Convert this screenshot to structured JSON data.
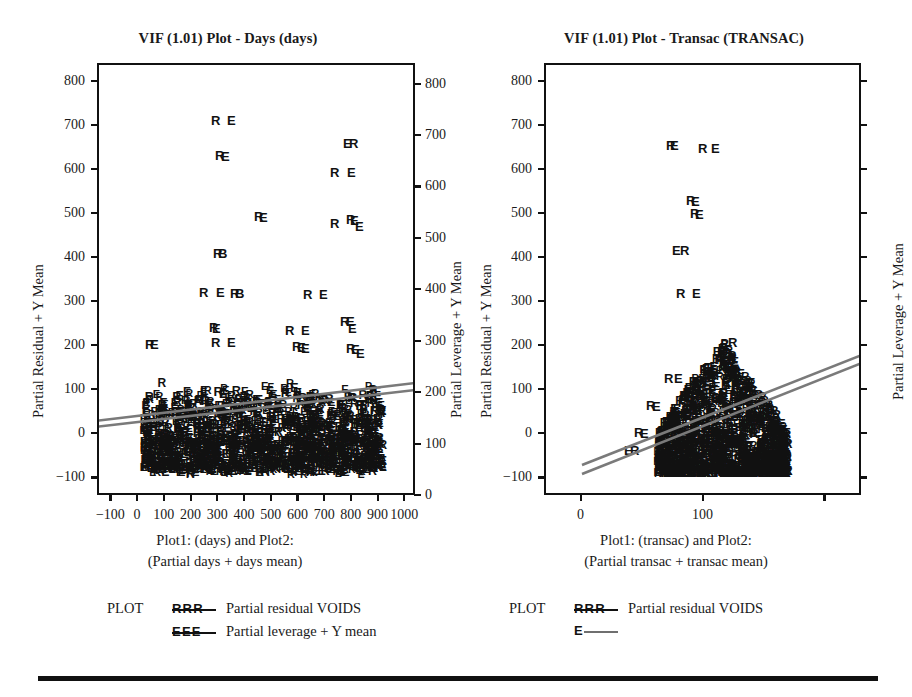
{
  "figure": {
    "background": "#ffffff",
    "ink_color": "#111111",
    "regression_line_color": "#7a7a7a",
    "bottom_rule": true
  },
  "legend_common": {
    "plot_word": "PLOT",
    "residual_keys": "R R R",
    "leverage_keys": "E E E",
    "residual_label": "Partial residual VOIDS",
    "leverage_label": "Partial leverage + Y mean"
  },
  "panels": [
    {
      "id": "left",
      "title": "VIF (1.01) Plot - Days (days)",
      "caption_line1": "Plot1: (days) and Plot2:",
      "caption_line2": "(Partial days + days mean)",
      "y_left_title": "Partial Residual + Y Mean",
      "y_right_title": "Partial Leverage + Y Mean",
      "y_left_ticks": [
        "800",
        "700",
        "600",
        "500",
        "400",
        "300",
        "200",
        "100",
        "0",
        "-100"
      ],
      "y_right_ticks": [
        "800",
        "700",
        "600",
        "500",
        "400",
        "300",
        "200",
        "100",
        "0"
      ],
      "x_ticks": [
        "-100",
        "0",
        "100",
        "200",
        "300",
        "400",
        "500",
        "600",
        "700",
        "800",
        "900",
        "1000"
      ],
      "legend_rows": [
        {
          "keys": "R R R",
          "label": "Partial residual VOIDS",
          "style": "keys"
        },
        {
          "keys": "E E E",
          "label": "Partial leverage + Y mean",
          "style": "keys"
        }
      ]
    },
    {
      "id": "right",
      "title": "VIF (1.01) Plot - Transac (TRANSAC)",
      "caption_line1": "Plot1: (transac) and Plot2:",
      "caption_line2": "(Partial transac + transac mean)",
      "y_left_title": "Partial Residual + Y Mean",
      "y_right_title": "Partial Leverage + Y Mean",
      "y_left_ticks": [
        "800",
        "700",
        "600",
        "500",
        "400",
        "300",
        "200",
        "100",
        "0",
        "-100"
      ],
      "y_right_ticks": [],
      "x_ticks": [
        "0",
        "100",
        "",
        ""
      ],
      "legend_rows": [
        {
          "keys": "R R R",
          "label": "Partial residual VOIDS",
          "style": "keys"
        },
        {
          "keys": "E",
          "label": "",
          "style": "line"
        }
      ]
    }
  ],
  "chart_data": [
    {
      "type": "scatter",
      "panel": "left",
      "title": "VIF (1.01) Plot - Days (days)",
      "xlabel": "Plot1: (days) and Plot2: (Partial days + days mean)",
      "ylabel": "Partial Residual + Y Mean",
      "y2label": "Partial Leverage + Y Mean",
      "xlim": [
        -150,
        1040
      ],
      "ylim": [
        -140,
        840
      ],
      "y2lim": [
        0,
        840
      ],
      "xticks": [
        -100,
        0,
        100,
        200,
        300,
        400,
        500,
        600,
        700,
        800,
        900,
        1000
      ],
      "yticks": [
        -100,
        0,
        100,
        200,
        300,
        400,
        500,
        600,
        700,
        800
      ],
      "y2ticks": [
        0,
        100,
        200,
        300,
        400,
        500,
        600,
        700,
        800
      ],
      "grid": false,
      "legend_position": "below-axes",
      "series": [
        {
          "name": "Partial residual VOIDS",
          "marker": "R",
          "outliers": [
            [
              320,
              712
            ],
            [
              333,
              644
            ],
            [
              368,
              525
            ],
            [
              348,
              455
            ],
            [
              265,
              382
            ],
            [
              350,
              352
            ],
            [
              742,
              655
            ],
            [
              700,
              622
            ],
            [
              700,
              522
            ],
            [
              745,
              520
            ],
            [
              625,
              320
            ],
            [
              660,
              245
            ],
            [
              700,
              230
            ],
            [
              710,
              212
            ],
            [
              200,
              210
            ],
            [
              300,
              192
            ],
            [
              150,
              170
            ],
            [
              575,
              205
            ],
            [
              600,
              160
            ]
          ]
        },
        {
          "name": "Partial leverage + Y mean",
          "marker": "E",
          "outliers": [
            [
              352,
              712
            ],
            [
              345,
              642
            ],
            [
              372,
              524
            ],
            [
              745,
              655
            ],
            [
              735,
              622
            ],
            [
              755,
              505
            ],
            [
              330,
              382
            ],
            [
              760,
              230
            ],
            [
              690,
              232
            ]
          ]
        }
      ],
      "dense_cloud": {
        "x_range": [
          0,
          900
        ],
        "y_range": [
          -90,
          140
        ],
        "description": "dense overlapping R and E letter glyphs forming a near-solid band"
      },
      "regression_lines": [
        {
          "name": "fit-upper",
          "x": [
            -100,
            960
          ],
          "y": [
            -18,
            70
          ]
        },
        {
          "name": "fit-lower",
          "x": [
            -100,
            960
          ],
          "y": [
            -30,
            58
          ]
        }
      ]
    },
    {
      "type": "scatter",
      "panel": "right",
      "title": "VIF (1.01) Plot - Transac (TRANSAC)",
      "xlabel": "Plot1: (transac) and Plot2: (Partial transac + transac mean)",
      "ylabel": "Partial Residual + Y Mean",
      "y2label": "Partial Leverage + Y Mean",
      "xlim": [
        -30,
        230
      ],
      "ylim": [
        -140,
        840
      ],
      "xticks": [
        0,
        100
      ],
      "yticks": [
        -100,
        0,
        100,
        200,
        300,
        400,
        500,
        600,
        700,
        800
      ],
      "grid": false,
      "legend_position": "below-axes",
      "series": [
        {
          "name": "Partial residual VOIDS",
          "marker": "R",
          "outliers": [
            [
              96,
              648
            ],
            [
              118,
              645
            ],
            [
              110,
              540
            ],
            [
              112,
              520
            ],
            [
              100,
              452
            ],
            [
              102,
              362
            ],
            [
              148,
              305
            ],
            [
              152,
              232
            ],
            [
              150,
              212
            ],
            [
              88,
              232
            ],
            [
              95,
              215
            ],
            [
              82,
              180
            ],
            [
              70,
              152
            ]
          ]
        },
        {
          "name": "Partial leverage + Y mean",
          "marker": "E",
          "outliers": [
            [
              92,
              648
            ],
            [
              124,
              645
            ],
            [
              114,
              538
            ],
            [
              116,
              512
            ],
            [
              96,
              452
            ],
            [
              108,
              362
            ],
            [
              156,
              205
            ],
            [
              130,
              248
            ],
            [
              120,
              190
            ]
          ]
        }
      ],
      "dense_cloud": {
        "x_range": [
          58,
          165
        ],
        "y_range": [
          -95,
          180
        ],
        "description": "dense overlapping R and E letter glyphs, triangular wedge widening upward"
      },
      "regression_lines": [
        {
          "name": "fit-upper",
          "x": [
            18,
            228
          ],
          "y": [
            -88,
            148
          ]
        },
        {
          "name": "fit-lower",
          "x": [
            18,
            228
          ],
          "y": [
            -108,
            130
          ]
        }
      ]
    }
  ]
}
